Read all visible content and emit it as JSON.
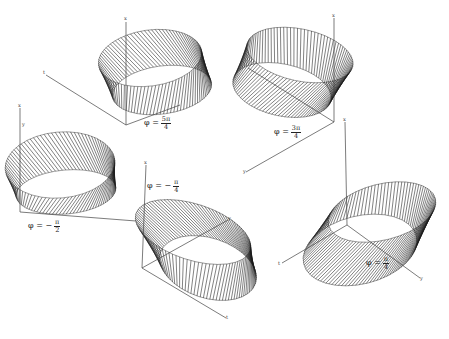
{
  "figure": {
    "top_caption_fragment": "",
    "panels": [
      {
        "id": "p1",
        "phi_prefix": "φ = ",
        "phi_num": "5π",
        "phi_den": "4",
        "axes": [
          "x",
          "t"
        ]
      },
      {
        "id": "p2",
        "phi_prefix": "φ = ",
        "phi_num": "3π",
        "phi_den": "4",
        "axes": [
          "x",
          "y"
        ]
      },
      {
        "id": "p3",
        "phi_prefix": "φ = −",
        "phi_num": "π",
        "phi_den": "2",
        "axes": [
          "x",
          "y"
        ]
      },
      {
        "id": "p4",
        "phi_prefix": "φ = −",
        "phi_num": "π",
        "phi_den": "4",
        "axes": [
          "x",
          "y",
          "t"
        ]
      },
      {
        "id": "p5",
        "phi_prefix": "φ = ",
        "phi_num": "π",
        "phi_den": "4",
        "axes": [
          "x",
          "y",
          "t"
        ]
      }
    ]
  },
  "colors": {
    "ink": "#1a1a1a",
    "axis": "#444444",
    "paper": "#ffffff"
  }
}
